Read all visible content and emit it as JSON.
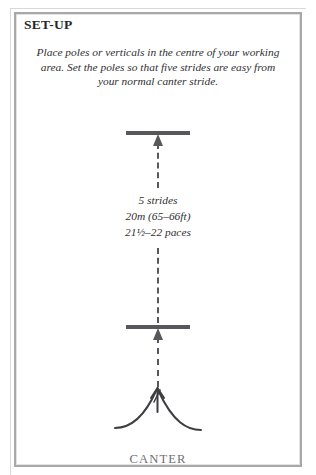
{
  "page": {
    "heading": "SET-UP",
    "intro_text": "Place poles or verticals in the centre of your working area. Set the poles so that five strides are easy from your normal canter stride.",
    "bottom_label": "CANTER",
    "border_color": "#a8a8aa",
    "ink_color": "#58585c",
    "text_color": "#2f2f33",
    "background_color": "#ffffff"
  },
  "measurements": {
    "line1": "5 strides",
    "line2": "20m (65–66ft)",
    "line3": "21½–22 paces"
  },
  "diagram": {
    "pole_top_label": "pole",
    "pole_bottom_label": "pole",
    "direction_line": "dashed travel line",
    "arrow_direction": "up",
    "gait_symbol": "canter-gait-symbol"
  }
}
